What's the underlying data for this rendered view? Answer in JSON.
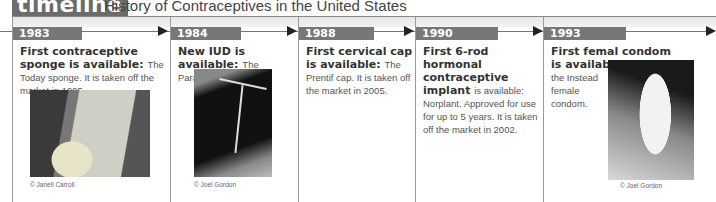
{
  "header": {
    "tab_label": "timeline",
    "title": "History of Contraceptives in the United States"
  },
  "colors": {
    "tab_bg": "#6b6b6b",
    "year_badge_bg": "#777777",
    "arrow": "#222222",
    "rule": "#8a8a8a"
  },
  "events": [
    {
      "year": "1983",
      "title_bold": "First contraceptive sponge is available:",
      "body": "The Today sponge. It is taken off the market in 1995.",
      "photo": "Today sponge package",
      "credit": "© Janell Carroll"
    },
    {
      "year": "1984",
      "title_bold": "New IUD is available:",
      "body": "The ParaGard Copper T.",
      "photo": "ParaGard Copper T IUD",
      "credit": "© Joel Gordon"
    },
    {
      "year": "1988",
      "title_bold": "First cervical cap is available:",
      "body": "The Prentif cap. It is taken off the market in 2005."
    },
    {
      "year": "1990",
      "title_bold": "First 6-rod hormonal contraceptive implant",
      "body": "is available: Norplant. Approved for use for up to 5 years. It is taken off the market in 2002."
    },
    {
      "year": "1993",
      "title_bold": "First femal condom is available:",
      "body": "the Instead female condom.",
      "photo": "Female condom held in hand",
      "credit": "© Joel Gordon"
    }
  ]
}
